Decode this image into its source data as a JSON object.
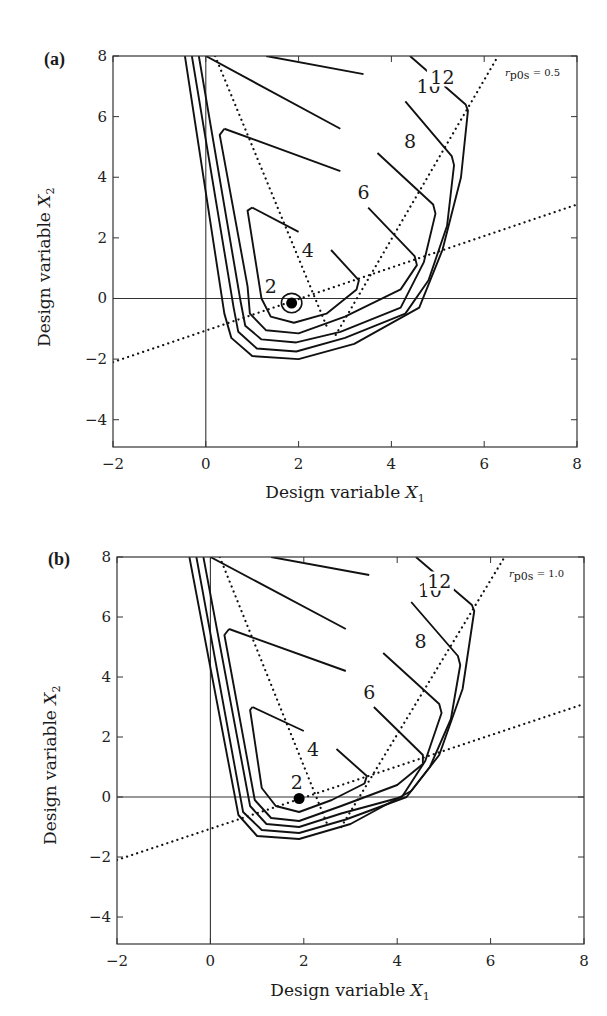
{
  "chart_data": [
    {
      "type": "contour",
      "panel": "(a)",
      "title": "",
      "annotation": "r_p0s = 0.5",
      "annotation_parts": {
        "symbol": "r",
        "sub": "p0s",
        "value": "= 0.5"
      },
      "xlabel": "Design variable X1",
      "xlabel_parts": {
        "text": "Design variable ",
        "var": "X",
        "sub": "1"
      },
      "ylabel": "Design variable X2",
      "ylabel_parts": {
        "text": "Design variable ",
        "var": "X",
        "sub": "2"
      },
      "xlim": [
        -2,
        8
      ],
      "ylim": [
        -4.9,
        8
      ],
      "xticks": [
        -2,
        0,
        2,
        4,
        6,
        8
      ],
      "yticks": [
        -4,
        -2,
        0,
        2,
        4,
        6,
        8
      ],
      "xtick_labels": [
        "−2",
        "0",
        "2",
        "4",
        "6",
        "8"
      ],
      "ytick_labels": [
        "−4",
        "−2",
        "0",
        "2",
        "4",
        "6",
        "8"
      ],
      "grid": false,
      "reference_lines": {
        "x": 0,
        "y": 0
      },
      "contour_levels": [
        2,
        4,
        6,
        8,
        10,
        12
      ],
      "contour_label_positions": [
        {
          "label": "2",
          "x": 1.4,
          "y": 0.4
        },
        {
          "label": "4",
          "x": 2.2,
          "y": 1.6
        },
        {
          "label": "6",
          "x": 3.4,
          "y": 3.5
        },
        {
          "label": "8",
          "x": 4.4,
          "y": 5.2
        },
        {
          "label": "10",
          "x": 4.8,
          "y": 7.0
        },
        {
          "label": "12",
          "x": 5.1,
          "y": 7.3
        }
      ],
      "optimum_point": {
        "x": 1.85,
        "y": -0.15
      },
      "dotted_lines": [
        {
          "name": "diagonal-constraint",
          "points": [
            [
              0.2,
              8
            ],
            [
              2.6,
              -0.9
            ]
          ]
        },
        {
          "name": "right-constraint",
          "points": [
            [
              2.8,
              -1.2
            ],
            [
              6.3,
              8
            ]
          ]
        },
        {
          "name": "sloped-constraint",
          "points": [
            [
              -2,
              -2.1
            ],
            [
              8,
              3.1
            ]
          ]
        }
      ],
      "contours": [
        {
          "level": 12,
          "points": [
            [
              4.4,
              8
            ],
            [
              5.6,
              6.4
            ],
            [
              5.65,
              6.2
            ],
            [
              5.5,
              4.0
            ],
            [
              5.1,
              1.6
            ],
            [
              4.6,
              -0.3
            ],
            [
              3.2,
              -1.5
            ],
            [
              2.0,
              -2.0
            ],
            [
              1.0,
              -1.9
            ],
            [
              0.55,
              -1.3
            ],
            [
              0.4,
              -0.5
            ],
            [
              -0.45,
              8
            ]
          ]
        },
        {
          "level": 10,
          "points": [
            [
              1.3,
              8
            ],
            [
              3.4,
              7.4
            ]
          ]
        },
        {
          "level": 10.1,
          "points": [
            [
              4.3,
              6.5
            ],
            [
              5.3,
              4.7
            ],
            [
              5.35,
              4.4
            ],
            [
              5.2,
              2.4
            ],
            [
              4.8,
              0.6
            ],
            [
              4.3,
              -0.5
            ],
            [
              3.0,
              -1.3
            ],
            [
              1.95,
              -1.75
            ],
            [
              1.1,
              -1.65
            ],
            [
              0.7,
              -1.1
            ],
            [
              0.6,
              -0.3
            ],
            [
              -0.3,
              8
            ]
          ]
        },
        {
          "level": 8,
          "points": [
            [
              0,
              8
            ],
            [
              2.9,
              5.6
            ]
          ]
        },
        {
          "level": 8.1,
          "points": [
            [
              3.7,
              4.8
            ],
            [
              4.9,
              3.1
            ],
            [
              4.95,
              2.8
            ],
            [
              4.7,
              1.2
            ],
            [
              4.2,
              -0.3
            ],
            [
              2.9,
              -1.1
            ],
            [
              1.95,
              -1.45
            ],
            [
              1.2,
              -1.35
            ],
            [
              0.85,
              -0.9
            ],
            [
              0.75,
              -0.1
            ],
            [
              -0.15,
              8
            ]
          ]
        },
        {
          "level": 6,
          "points": [
            [
              0.4,
              5.6
            ],
            [
              2.9,
              4.2
            ]
          ]
        },
        {
          "level": 6.1,
          "points": [
            [
              3.5,
              3.0
            ],
            [
              4.5,
              1.4
            ],
            [
              4.55,
              1.1
            ],
            [
              4.2,
              0.3
            ],
            [
              3.0,
              -0.6
            ],
            [
              2.0,
              -1.15
            ],
            [
              1.3,
              -1.05
            ],
            [
              0.95,
              -0.5
            ],
            [
              0.9,
              0.4
            ],
            [
              0.3,
              5.4
            ],
            [
              0.4,
              5.6
            ]
          ]
        },
        {
          "level": 4,
          "points": [
            [
              1.0,
              3.0
            ],
            [
              2.0,
              2.2
            ]
          ]
        },
        {
          "level": 4.1,
          "points": [
            [
              2.7,
              1.6
            ],
            [
              3.3,
              0.6
            ],
            [
              3.25,
              0.3
            ],
            [
              2.6,
              -0.5
            ],
            [
              1.9,
              -0.8
            ],
            [
              1.4,
              -0.6
            ],
            [
              1.2,
              0.0
            ],
            [
              0.9,
              2.9
            ],
            [
              1.0,
              3.0
            ]
          ]
        }
      ],
      "inner_ring": {
        "cx": 1.85,
        "cy": -0.15,
        "rx": 0.22,
        "ry": 0.32
      }
    },
    {
      "type": "contour",
      "panel": "(b)",
      "title": "",
      "annotation": "r_p0s = 1.0",
      "annotation_parts": {
        "symbol": "r",
        "sub": "p0s",
        "value": "= 1.0"
      },
      "xlabel": "Design variable X1",
      "xlabel_parts": {
        "text": "Design variable ",
        "var": "X",
        "sub": "1"
      },
      "ylabel": "Design variable X2",
      "ylabel_parts": {
        "text": "Design variable ",
        "var": "X",
        "sub": "2"
      },
      "xlim": [
        -2,
        8
      ],
      "ylim": [
        -4.9,
        8
      ],
      "xticks": [
        -2,
        0,
        2,
        4,
        6,
        8
      ],
      "yticks": [
        -4,
        -2,
        0,
        2,
        4,
        6,
        8
      ],
      "xtick_labels": [
        "−2",
        "0",
        "2",
        "4",
        "6",
        "8"
      ],
      "ytick_labels": [
        "−4",
        "−2",
        "0",
        "2",
        "4",
        "6",
        "8"
      ],
      "grid": false,
      "reference_lines": {
        "x": 0,
        "y": 0
      },
      "contour_levels": [
        2,
        4,
        6,
        8,
        10,
        12
      ],
      "contour_label_positions": [
        {
          "label": "2",
          "x": 1.85,
          "y": 0.5
        },
        {
          "label": "4",
          "x": 2.2,
          "y": 1.6
        },
        {
          "label": "6",
          "x": 3.4,
          "y": 3.5
        },
        {
          "label": "8",
          "x": 4.5,
          "y": 5.2
        },
        {
          "label": "10",
          "x": 4.7,
          "y": 6.9
        },
        {
          "label": "12",
          "x": 4.9,
          "y": 7.2
        }
      ],
      "optimum_point": {
        "x": 1.9,
        "y": -0.05
      },
      "dotted_lines": [
        {
          "name": "diagonal-constraint",
          "points": [
            [
              0.2,
              8
            ],
            [
              2.5,
              -0.9
            ]
          ]
        },
        {
          "name": "right-constraint",
          "points": [
            [
              2.8,
              -1.0
            ],
            [
              6.3,
              8
            ]
          ]
        },
        {
          "name": "sloped-constraint",
          "points": [
            [
              -2,
              -2.1
            ],
            [
              8,
              3.1
            ]
          ]
        }
      ],
      "contours": [
        {
          "level": 12,
          "points": [
            [
              4.4,
              8
            ],
            [
              5.6,
              6.4
            ],
            [
              5.65,
              6.2
            ],
            [
              5.4,
              3.6
            ],
            [
              4.9,
              1.4
            ],
            [
              4.3,
              0.2
            ],
            [
              3.0,
              -0.9
            ],
            [
              1.9,
              -1.4
            ],
            [
              1.0,
              -1.3
            ],
            [
              0.6,
              -0.6
            ],
            [
              -0.45,
              8
            ]
          ]
        },
        {
          "level": 10,
          "points": [
            [
              1.3,
              8
            ],
            [
              3.4,
              7.4
            ]
          ]
        },
        {
          "level": 10.1,
          "points": [
            [
              4.3,
              6.5
            ],
            [
              5.3,
              4.7
            ],
            [
              5.35,
              4.4
            ],
            [
              5.15,
              2.6
            ],
            [
              4.7,
              1.0
            ],
            [
              4.2,
              0.0
            ],
            [
              2.9,
              -0.75
            ],
            [
              1.9,
              -1.2
            ],
            [
              1.1,
              -1.1
            ],
            [
              0.7,
              -0.5
            ],
            [
              -0.3,
              8
            ]
          ]
        },
        {
          "level": 8,
          "points": [
            [
              0,
              8
            ],
            [
              2.9,
              5.6
            ]
          ]
        },
        {
          "level": 8.1,
          "points": [
            [
              3.7,
              4.8
            ],
            [
              4.9,
              3.1
            ],
            [
              4.95,
              2.8
            ],
            [
              4.6,
              1.2
            ],
            [
              4.1,
              0.0
            ],
            [
              2.8,
              -0.55
            ],
            [
              1.9,
              -1.0
            ],
            [
              1.2,
              -0.9
            ],
            [
              0.85,
              -0.3
            ],
            [
              -0.15,
              8
            ]
          ]
        },
        {
          "level": 6,
          "points": [
            [
              0.4,
              5.6
            ],
            [
              2.9,
              4.2
            ]
          ]
        },
        {
          "level": 6.1,
          "points": [
            [
              3.5,
              3.0
            ],
            [
              4.55,
              1.4
            ],
            [
              4.55,
              1.1
            ],
            [
              4.0,
              0.4
            ],
            [
              2.8,
              -0.3
            ],
            [
              1.9,
              -0.8
            ],
            [
              1.3,
              -0.7
            ],
            [
              0.95,
              -0.1
            ],
            [
              0.3,
              5.4
            ],
            [
              0.4,
              5.6
            ]
          ]
        },
        {
          "level": 4,
          "points": [
            [
              0.9,
              3.0
            ],
            [
              2.0,
              2.2
            ]
          ]
        },
        {
          "level": 4.1,
          "points": [
            [
              2.7,
              1.6
            ],
            [
              3.35,
              0.7
            ],
            [
              3.3,
              0.45
            ],
            [
              2.6,
              -0.1
            ],
            [
              1.9,
              -0.5
            ],
            [
              1.4,
              -0.3
            ],
            [
              1.1,
              0.3
            ],
            [
              0.85,
              2.9
            ],
            [
              0.9,
              3.0
            ]
          ]
        }
      ],
      "inner_ring": null
    }
  ],
  "panels": [
    {
      "tag": "(a)",
      "top": 56,
      "left": 113,
      "right": 577,
      "bottom": 447
    },
    {
      "tag": "(b)",
      "top": 557,
      "left": 117,
      "right": 584,
      "bottom": 944
    }
  ]
}
